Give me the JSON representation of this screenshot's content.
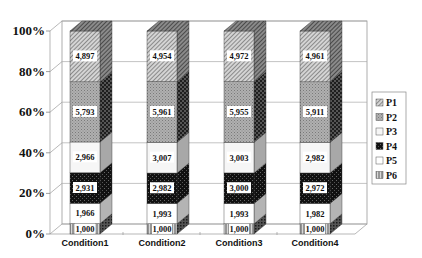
{
  "chart_data": {
    "type": "bar",
    "subtype": "3d-100%-stacked-column",
    "title": "",
    "xlabel": "",
    "ylabel": "",
    "categories": [
      "Condition1",
      "Condition2",
      "Condition3",
      "Condition4"
    ],
    "y_ticks": [
      "0%",
      "20%",
      "40%",
      "60%",
      "80%",
      "100%"
    ],
    "ylim": [
      0,
      100
    ],
    "grid": true,
    "legend_position": "right",
    "stack_order_bottom_to_top": [
      "P6",
      "P5",
      "P4",
      "P3",
      "P2",
      "P1"
    ],
    "series": [
      {
        "name": "P1",
        "values": [
          4897,
          4954,
          4972,
          4961
        ],
        "labels": [
          "4,897",
          "4,954",
          "4,972",
          "4,961"
        ],
        "pattern": "diagonal-hatch",
        "color": "#b8b8b8"
      },
      {
        "name": "P2",
        "values": [
          5793,
          5961,
          5955,
          5911
        ],
        "labels": [
          "5,793",
          "5,961",
          "5,955",
          "5,911"
        ],
        "pattern": "grid-check",
        "color": "#a0a0a0"
      },
      {
        "name": "P3",
        "values": [
          2966,
          3007,
          3003,
          2982
        ],
        "labels": [
          "2,966",
          "3,007",
          "3,003",
          "2,982"
        ],
        "pattern": "solid",
        "color": "#f4f4f4"
      },
      {
        "name": "P4",
        "values": [
          2931,
          2982,
          3000,
          2972
        ],
        "labels": [
          "2,931",
          "2,982",
          "3,000",
          "2,972"
        ],
        "pattern": "dark-check",
        "color": "#1a1a1a"
      },
      {
        "name": "P5",
        "values": [
          1966,
          1993,
          1993,
          1982
        ],
        "labels": [
          "1,966",
          "1,993",
          "1,993",
          "1,982"
        ],
        "pattern": "solid",
        "color": "#ffffff"
      },
      {
        "name": "P6",
        "values": [
          1000,
          1000,
          1000,
          1000
        ],
        "labels": [
          "1,000",
          "1,000",
          "1,000",
          "1,000"
        ],
        "pattern": "vertical-lines",
        "color": "#9a9a9a"
      }
    ]
  }
}
